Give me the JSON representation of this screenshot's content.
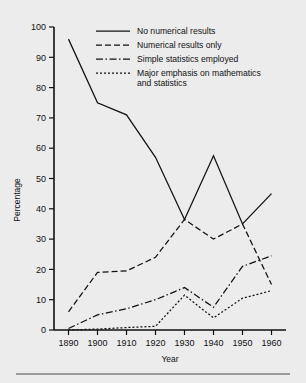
{
  "chart_data": {
    "type": "line",
    "title": "",
    "xlabel": "Year",
    "ylabel": "Percentage",
    "x": [
      1890,
      1900,
      1910,
      1920,
      1930,
      1940,
      1950,
      1960
    ],
    "xticklabels": [
      "1890",
      "1900",
      "1910",
      "1920",
      "1930",
      "1940",
      "1950",
      "1960"
    ],
    "yticks": [
      0,
      10,
      20,
      30,
      40,
      50,
      60,
      70,
      80,
      90,
      100
    ],
    "yticklabels": [
      "0",
      "10",
      "20",
      "30",
      "40",
      "50",
      "60",
      "70",
      "80",
      "90",
      "100"
    ],
    "xlim": [
      1885,
      1965
    ],
    "ylim": [
      0,
      100
    ],
    "grid": false,
    "legend_position": "top-right-inside",
    "series": [
      {
        "name": "No numerical results",
        "style": "solid",
        "values": [
          96,
          75,
          71,
          57,
          36.5,
          57.5,
          35,
          45
        ]
      },
      {
        "name": "Numerical results only",
        "style": "dashed",
        "values": [
          6,
          19,
          19.5,
          24,
          36.5,
          30,
          35,
          15
        ]
      },
      {
        "name": "Simple statistics employed",
        "style": "dash-dot",
        "values": [
          0.5,
          5,
          7,
          10,
          14,
          7.5,
          21,
          24.5
        ]
      },
      {
        "name": "Major emphasis on mathematics and statistics",
        "style": "dotted",
        "values": [
          0,
          0.3,
          0.8,
          1.2,
          11.5,
          4,
          10.5,
          13
        ]
      }
    ]
  },
  "legend": {
    "entries": [
      {
        "label": "No numerical results"
      },
      {
        "label": "Numerical results only"
      },
      {
        "label": "Simple statistics employed"
      },
      {
        "label_line1": "Major emphasis on mathematics",
        "label_line2": "and statistics"
      }
    ]
  },
  "colors": {
    "background": "#ececed",
    "ink": "#111111",
    "rule": "#4a4a4a"
  }
}
